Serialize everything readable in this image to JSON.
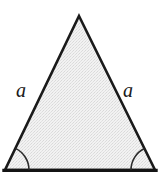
{
  "figure": {
    "kind": "isosceles-triangle-diagram",
    "background_color": "#ffffff",
    "canvas": {
      "width": 163,
      "height": 180
    },
    "triangle": {
      "name": "isosceles-triangle",
      "apex": {
        "x": 79,
        "y": 16
      },
      "bottom_left": {
        "x": 5,
        "y": 170
      },
      "bottom_right": {
        "x": 155,
        "y": 170
      },
      "fill_color": "#ebebeb",
      "fill_style": "stipple",
      "stroke_color": "#1a1a1a",
      "stroke_width": 2.6,
      "base_stroke_width": 3.4
    },
    "labels": {
      "left_side": "a",
      "right_side": "a",
      "text_color": "#1a1a1a",
      "font_size": "20px",
      "font_style": "italic"
    },
    "angle_marks": {
      "stroke_color": "#2b2b2b",
      "stroke_width": 1.6,
      "radius": 24,
      "left": {
        "name": "base-angle-left",
        "vertex": {
          "x": 5,
          "y": 170
        }
      },
      "right": {
        "name": "base-angle-right",
        "vertex": {
          "x": 155,
          "y": 170
        }
      }
    }
  }
}
